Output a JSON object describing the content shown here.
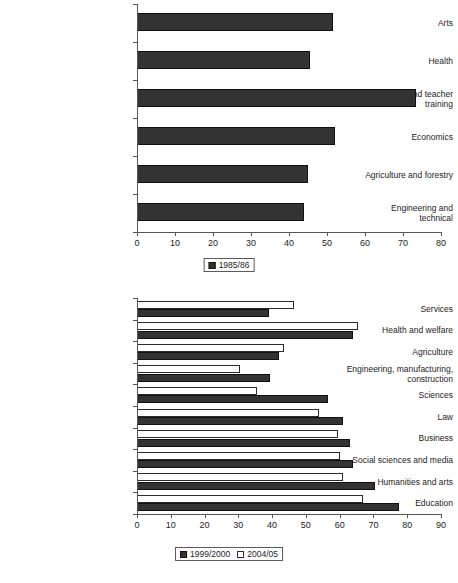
{
  "chart_data": [
    {
      "id": "top",
      "type": "bar",
      "orientation": "horizontal",
      "title": "",
      "xlabel": "",
      "ylabel": "",
      "xlim": [
        0,
        80
      ],
      "xticks": [
        0,
        10,
        20,
        30,
        40,
        50,
        60,
        70,
        80
      ],
      "grid": false,
      "legend_position": "bottom-center",
      "categories": [
        "Arts",
        "Health",
        "Education and teacher\ntraining",
        "Economics",
        "Agriculture and forestry",
        "Engineering and\ntechnical"
      ],
      "series": [
        {
          "name": "1985/86",
          "style": "dark",
          "color": "#333333",
          "values": [
            51.5,
            45.5,
            73.5,
            52.0,
            45.0,
            44.0
          ]
        }
      ]
    },
    {
      "id": "bottom",
      "type": "bar",
      "orientation": "horizontal",
      "title": "",
      "xlabel": "",
      "ylabel": "",
      "xlim": [
        0,
        90
      ],
      "xticks": [
        0,
        10,
        20,
        30,
        40,
        50,
        60,
        70,
        80,
        90
      ],
      "grid": false,
      "legend_position": "bottom-center",
      "categories": [
        "Services",
        "Health and welfare",
        "Agriculture",
        "Engineering, manufacturing,\nconstruction",
        "Sciences",
        "Law",
        "Business",
        "Social sciences and media",
        "Humanities and arts",
        "Education"
      ],
      "series": [
        {
          "name": "1999/2000",
          "style": "dark",
          "color": "#333333",
          "values": [
            39.0,
            64.0,
            42.0,
            39.5,
            56.5,
            61.0,
            63.0,
            64.0,
            70.5,
            77.5
          ]
        },
        {
          "name": "2004/05",
          "style": "light",
          "color": "#ffffff",
          "values": [
            46.5,
            65.5,
            43.5,
            30.5,
            35.5,
            54.0,
            59.5,
            60.0,
            61.0,
            67.0
          ]
        }
      ]
    }
  ],
  "legend_top": {
    "entries": [
      {
        "label": "1985/86",
        "style": "dark"
      }
    ]
  },
  "legend_bottom": {
    "entries": [
      {
        "label": "1999/2000",
        "style": "dark"
      },
      {
        "label": "2004/05",
        "style": "light"
      }
    ]
  }
}
